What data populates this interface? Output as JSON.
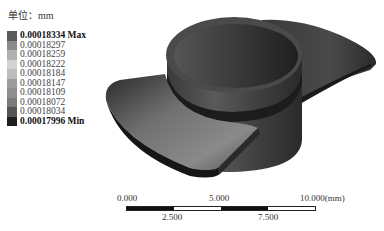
{
  "legend": {
    "unit_label": "单位：mm",
    "entries": [
      {
        "value": "0.00018334 Max",
        "color": "#5a5a5a",
        "bold": true
      },
      {
        "value": "0.00018297",
        "color": "#8a8a8a",
        "bold": false
      },
      {
        "value": "0.00018259",
        "color": "#b0b0b0",
        "bold": false
      },
      {
        "value": "0.00018222",
        "color": "#d2d2d2",
        "bold": false
      },
      {
        "value": "0.00018184",
        "color": "#bdbdbd",
        "bold": false
      },
      {
        "value": "0.00018147",
        "color": "#9c9c9c",
        "bold": false
      },
      {
        "value": "0.00018109",
        "color": "#8f8f8f",
        "bold": false
      },
      {
        "value": "0.00018072",
        "color": "#7a7a7a",
        "bold": false
      },
      {
        "value": "0.00018034",
        "color": "#555555",
        "bold": false
      },
      {
        "value": "0.00017996 Min",
        "color": "#1e1e1e",
        "bold": true
      }
    ]
  },
  "scale_bar": {
    "top_labels": [
      "0.000",
      "5.000",
      "10.000(mm)"
    ],
    "bottom_labels": [
      "2.500",
      "7.500"
    ],
    "segments": [
      "#111111",
      "#ffffff",
      "#111111",
      "#ffffff"
    ]
  },
  "model": {
    "description": "3D part with cylindrical cup and two curved flanges",
    "base_color": "#3a3a3a"
  }
}
